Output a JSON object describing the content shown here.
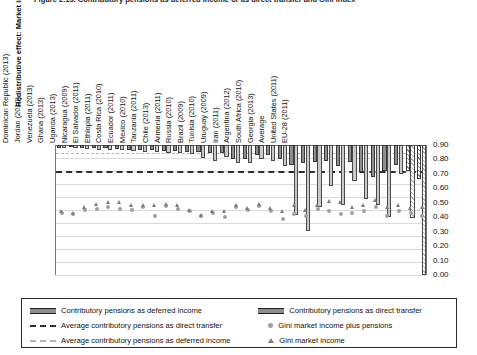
{
  "figure": {
    "title": "Figure 2.13. Contributory pensions as deferred income or as direct transfer and Gini index",
    "y_axis_title": "Redistributive effect: Market income to disposable"
  },
  "legend": {
    "items": [
      {
        "key": "deferred_bar",
        "label": "Contributory pensions as deferred income",
        "marker": "solid-dark"
      },
      {
        "key": "direct_bar",
        "label": "Contributory pensions as direct transfer",
        "marker": "solid-light"
      },
      {
        "key": "avg_direct",
        "label": "Average contributory pensions as direct transfer",
        "marker": "dash-dark"
      },
      {
        "key": "gini_plus_pen",
        "label": "Gini market income plus pensions",
        "marker": "circle"
      },
      {
        "key": "avg_deferred",
        "label": "Average contributory pensions as deferred income",
        "marker": "dash-light"
      },
      {
        "key": "gini_market",
        "label": "Gini market income",
        "marker": "triangle"
      }
    ]
  },
  "chart_data": {
    "type": "bar",
    "title": "Figure 2.13. Contributory pensions as deferred income or as direct transfer and Gini index",
    "xlabel": "",
    "ylabel": "Redistributive effect: Market income to disposable",
    "ylabel_right": "Gini index",
    "ylim": [
      -0.2,
      0.0
    ],
    "ylim_right": [
      0.0,
      0.9
    ],
    "grid": true,
    "legend_position": "bottom",
    "y_ticks": [
      "0.00",
      "-0.02",
      "-0.04",
      "-0.06",
      "-0.08",
      "-0.10",
      "-0.12",
      "-0.14",
      "-0.16",
      "-0.18",
      "-0.20"
    ],
    "y_ticks_right": [
      "0.90",
      "0.80",
      "0.70",
      "0.60",
      "0.50",
      "0.40",
      "0.30",
      "0.20",
      "0.10",
      "0.00"
    ],
    "categories": [
      "Indonesia (2012)",
      "Sri Lanka (2010)",
      "Honduras (2011)",
      "Colombia (2010)",
      "Guatemala (2011)",
      "Bolivia (2009)",
      "Peru (2009)",
      "Dominican Republic (2013)",
      "Jordan (2010)",
      "Venezuela (2013)",
      "Ghana (2013)",
      "Uganda (2013)",
      "Nicaragua (2009)",
      "El Salvador (2011)",
      "Ethiopia (2011)",
      "Costa Rica (2010)",
      "Ecuador (2011)",
      "Mexico (2010)",
      "Tanzania (2011)",
      "Chile (2013)",
      "Armenia (2011)",
      "Russia (2010)",
      "Brazil (2009)",
      "Tunisia (2010)",
      "Uruguay (2009)",
      "Iran (2011)",
      "Argentina (2012)",
      "South Africa (2010)",
      "Georgia (2013)",
      "Average",
      "United States (2011)",
      "EU-28 (2011)"
    ],
    "series": [
      {
        "name": "Contributory pensions as deferred income",
        "axis": "left",
        "values": [
          -0.004,
          -0.003,
          -0.004,
          -0.005,
          -0.005,
          -0.006,
          -0.007,
          -0.007,
          -0.008,
          -0.009,
          -0.009,
          -0.01,
          -0.011,
          -0.013,
          -0.013,
          -0.021,
          -0.021,
          -0.015,
          -0.016,
          -0.022,
          -0.03,
          -0.027,
          -0.026,
          -0.025,
          -0.033,
          -0.026,
          -0.042,
          -0.049,
          -0.04,
          -0.03,
          -0.04,
          -0.052
        ]
      },
      {
        "name": "Contributory pensions as direct transfer",
        "axis": "left",
        "values": [
          -0.005,
          -0.004,
          -0.006,
          -0.007,
          -0.007,
          -0.008,
          -0.009,
          -0.01,
          -0.011,
          -0.012,
          -0.012,
          -0.014,
          -0.02,
          -0.024,
          -0.019,
          -0.028,
          -0.028,
          -0.022,
          -0.024,
          -0.033,
          -0.107,
          -0.132,
          -0.096,
          -0.063,
          -0.092,
          -0.056,
          -0.083,
          -0.092,
          -0.111,
          -0.045,
          -0.113,
          -0.2
        ]
      },
      {
        "name": "Gini market income plus pensions",
        "axis": "right",
        "type": "scatter",
        "marker": "circle",
        "values": [
          0.43,
          0.42,
          0.45,
          0.46,
          0.47,
          0.46,
          0.45,
          0.47,
          0.41,
          0.48,
          0.46,
          0.44,
          0.41,
          0.43,
          0.4,
          0.47,
          0.45,
          0.48,
          0.44,
          0.39,
          0.42,
          0.41,
          0.46,
          0.44,
          0.42,
          0.43,
          0.44,
          0.47,
          0.41,
          0.44,
          0.43,
          0.41
        ]
      },
      {
        "name": "Gini market income",
        "axis": "right",
        "type": "scatter",
        "marker": "triangle",
        "values": [
          0.44,
          0.43,
          0.47,
          0.49,
          0.5,
          0.5,
          0.48,
          0.48,
          0.48,
          0.49,
          0.48,
          0.45,
          0.41,
          0.44,
          0.44,
          0.48,
          0.46,
          0.49,
          0.46,
          0.44,
          0.48,
          0.45,
          0.48,
          0.51,
          0.5,
          0.47,
          0.48,
          0.52,
          0.47,
          0.48,
          0.46,
          0.47
        ]
      }
    ],
    "reference_lines": [
      {
        "name": "Average contributory pensions as deferred income",
        "value": -0.012,
        "style": "dashed-light"
      },
      {
        "name": "Average contributory pensions as direct transfer",
        "value": -0.04,
        "style": "dashed-dark"
      }
    ]
  }
}
